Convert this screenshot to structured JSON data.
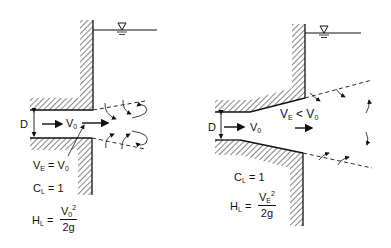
{
  "left_diagram": {
    "name": "Sharp-edged outlet (no expansion)",
    "labels": {
      "diameter": "D",
      "velocity": "V",
      "velocity_sub": "0",
      "relation_lhs": "V",
      "relation_lhs_sub": "E",
      "relation_op": " = V",
      "relation_rhs_sub": "0",
      "coef": "C",
      "coef_sub": "L",
      "coef_val": " = 1",
      "head": "H",
      "head_sub": "L",
      "head_eq": " =",
      "num": "V",
      "num_sub": "0",
      "num_sup": "2",
      "den": "2g"
    }
  },
  "right_diagram": {
    "name": "Flared outlet (gradual expansion)",
    "labels": {
      "diameter": "D",
      "velocity": "V",
      "velocity_sub": "0",
      "relation_lhs": "V",
      "relation_lhs_sub": "E",
      "relation_op": " < V",
      "relation_rhs_sub": "0",
      "coef": "C",
      "coef_sub": "L",
      "coef_val": " = 1",
      "head": "H",
      "head_sub": "L",
      "head_eq": " =",
      "num": "V",
      "num_sub": "E",
      "num_sup": "2",
      "den": "2g"
    }
  },
  "colors": {
    "ink": "#111111",
    "background": "#ffffff"
  }
}
